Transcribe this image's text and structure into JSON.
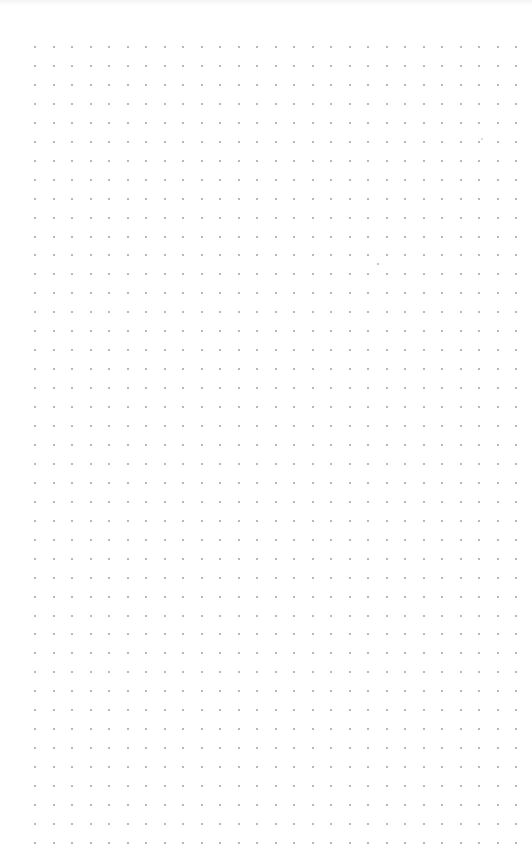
{
  "canvas": {
    "background": "#ffffff",
    "grid": {
      "type": "dot-grid",
      "dot_color": "#a0a0a0",
      "dot_size": 2,
      "origin_x": 35,
      "origin_y": 47,
      "spacing_x": 18.5,
      "spacing_y": 18.95,
      "columns": 27,
      "rows": 43
    },
    "stray_dots": [
      {
        "x": 378,
        "y": 264,
        "color": "#b0b0b0"
      },
      {
        "x": 482,
        "y": 139,
        "color": "#d0d0d0"
      }
    ]
  }
}
